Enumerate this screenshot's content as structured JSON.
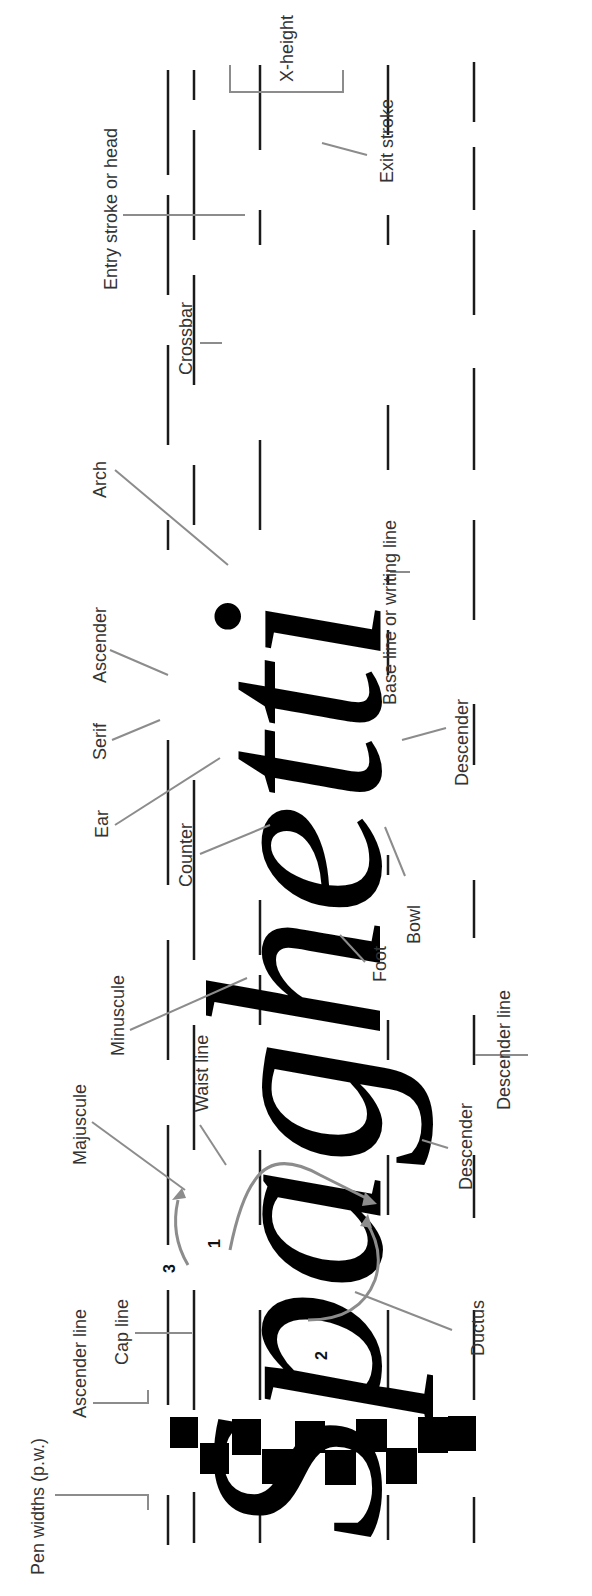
{
  "diagram": {
    "word": "Spaghetti",
    "letters": [
      "S",
      "p",
      "a",
      "g",
      "h",
      "e",
      "t",
      "t",
      "i"
    ],
    "orientation": "rotated 90° counter-clockwise",
    "guide_lines": [
      "Ascender line",
      "Cap line",
      "Waist line",
      "Base line or writing line",
      "Descender line"
    ],
    "labels": {
      "pen_widths": "Pen widths (p.w.)",
      "ascender_line": "Ascender line",
      "cap_line": "Cap line",
      "majuscule": "Majuscule",
      "waist_line": "Waist line",
      "minuscule": "Minuscule",
      "descender_p": "Descender",
      "descender_line": "Descender line",
      "ductus": "Ductus",
      "foot": "Foot",
      "bowl": "Bowl",
      "counter": "Counter",
      "ear": "Ear",
      "serif": "Serif",
      "ascender": "Ascender",
      "arch": "Arch",
      "descender_g": "Descender",
      "base_line": "Base line or writing line",
      "crossbar": "Crossbar",
      "entry_stroke": "Entry stroke or head",
      "exit_stroke": "Exit stroke",
      "x_height": "X-height"
    },
    "ductus_numbers": [
      "1",
      "2",
      "3"
    ],
    "pen_width_blocks": 10,
    "colors": {
      "ink": "#000000",
      "leader": "#8c8c8c",
      "label": "#333333",
      "background": "#ffffff"
    }
  }
}
